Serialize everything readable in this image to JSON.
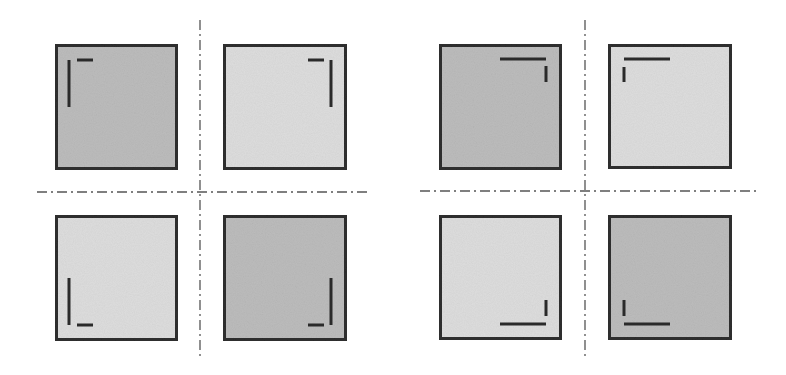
{
  "colors": {
    "background": "#ffffff",
    "border": "#2e2e2e",
    "fill_dark": "#bcbcbc",
    "fill_light": "#dddddd",
    "mark": "#2a2a2a",
    "axis": "#555555"
  },
  "panels": [
    {
      "name": "left-panel",
      "axes": {
        "vertical": {
          "x": 200,
          "y1": 20,
          "y2": 358
        },
        "horizontal": {
          "y": 192,
          "x1": 37,
          "x2": 370
        }
      },
      "squares": [
        {
          "name": "square-top-left",
          "x": 53,
          "y": 42,
          "w": 127,
          "h": 130,
          "shade": "dark",
          "marks": [
            {
              "x1": 69,
              "y1": 60,
              "x2": 69,
              "y2": 107
            },
            {
              "x1": 77,
              "y1": 60,
              "x2": 93,
              "y2": 60
            }
          ]
        },
        {
          "name": "square-top-right",
          "x": 221,
          "y": 42,
          "w": 128,
          "h": 130,
          "shade": "light",
          "marks": [
            {
              "x1": 331,
              "y1": 60,
              "x2": 331,
              "y2": 107
            },
            {
              "x1": 308,
              "y1": 60,
              "x2": 324,
              "y2": 60
            }
          ]
        },
        {
          "name": "square-bottom-left",
          "x": 53,
          "y": 213,
          "w": 127,
          "h": 130,
          "shade": "light",
          "marks": [
            {
              "x1": 69,
              "y1": 278,
              "x2": 69,
              "y2": 325
            },
            {
              "x1": 77,
              "y1": 325,
              "x2": 93,
              "y2": 325
            }
          ]
        },
        {
          "name": "square-bottom-right",
          "x": 221,
          "y": 213,
          "w": 128,
          "h": 130,
          "shade": "dark",
          "marks": [
            {
              "x1": 331,
              "y1": 278,
              "x2": 331,
              "y2": 325
            },
            {
              "x1": 308,
              "y1": 325,
              "x2": 324,
              "y2": 325
            }
          ]
        }
      ]
    },
    {
      "name": "right-panel",
      "axes": {
        "vertical": {
          "x": 585,
          "y1": 20,
          "y2": 358
        },
        "horizontal": {
          "y": 191,
          "x1": 420,
          "x2": 756
        }
      },
      "squares": [
        {
          "name": "square-top-left",
          "x": 437,
          "y": 42,
          "w": 127,
          "h": 130,
          "shade": "dark",
          "marks": [
            {
              "x1": 500,
              "y1": 59,
              "x2": 546,
              "y2": 59
            },
            {
              "x1": 546,
              "y1": 66,
              "x2": 546,
              "y2": 82
            }
          ]
        },
        {
          "name": "square-top-right",
          "x": 606,
          "y": 42,
          "w": 128,
          "h": 129,
          "shade": "light",
          "marks": [
            {
              "x1": 624,
              "y1": 59,
              "x2": 670,
              "y2": 59
            },
            {
              "x1": 624,
              "y1": 67,
              "x2": 624,
              "y2": 82
            }
          ]
        },
        {
          "name": "square-bottom-left",
          "x": 437,
          "y": 213,
          "w": 127,
          "h": 129,
          "shade": "light",
          "marks": [
            {
              "x1": 546,
              "y1": 300,
              "x2": 546,
              "y2": 316
            },
            {
              "x1": 500,
              "y1": 324,
              "x2": 546,
              "y2": 324
            }
          ]
        },
        {
          "name": "square-bottom-right",
          "x": 606,
          "y": 213,
          "w": 128,
          "h": 129,
          "shade": "dark",
          "marks": [
            {
              "x1": 624,
              "y1": 300,
              "x2": 624,
              "y2": 316
            },
            {
              "x1": 624,
              "y1": 324,
              "x2": 670,
              "y2": 324
            }
          ]
        }
      ]
    }
  ],
  "style": {
    "border_width": 5,
    "mark_width": 3,
    "axis_width": 1.3,
    "axis_dash": "10 4 2 4"
  }
}
